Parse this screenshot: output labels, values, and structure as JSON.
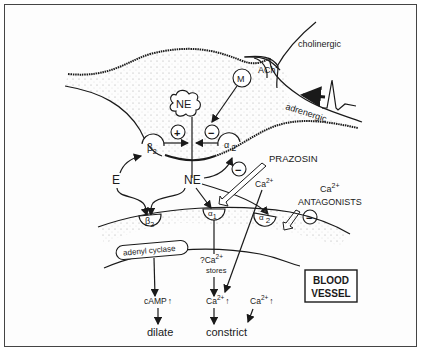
{
  "diagram": {
    "neuron": {
      "vesicle_label": "NE",
      "stimulate_sign": "+",
      "inhibit_sign": "−",
      "presyn_beta2": "β",
      "presyn_beta2_sub": "2",
      "presyn_alpha2": "α",
      "presyn_alpha2_sub": "2",
      "muscarinic_label": "M"
    },
    "nerves": {
      "cholinergic_label": "cholinergic",
      "ach_label": "ACh",
      "adrenergic_label": "adrenergic"
    },
    "agonists": {
      "epinephrine": "E",
      "norepinephrine": "NE"
    },
    "drugs": {
      "prazosin_label": "PRAZOSIN",
      "prazosin_sign": "−",
      "ca_antagonists_line1": "Ca",
      "ca_antagonists_sup": "2+",
      "ca_antagonists_line2": "ANTAGONISTS",
      "ca_antagonists_sign": "−"
    },
    "vessel": {
      "receptor_beta2": "β",
      "receptor_beta2_sub": "2",
      "receptor_alpha1": "α",
      "receptor_alpha1_sub": "1",
      "receptor_alpha2": "α",
      "receptor_alpha2_sub": "2",
      "enzyme_label": "adenyl cyclase",
      "ca_stores_line1": "?Ca",
      "ca_stores_sup": "2+",
      "ca_stores_line2": "stores",
      "extracellular_ca": "Ca",
      "extracellular_ca_sup": "2+",
      "camp_label": "cAMP",
      "ca_up_1": "Ca",
      "ca_up_1_sup": "2+",
      "ca_up_2": "Ca",
      "ca_up_2_sup": "2+",
      "up_arrow": "↑",
      "outcome_dilate": "dilate",
      "outcome_constrict": "constrict",
      "title_line1": "BLOOD",
      "title_line2": "VESSEL"
    }
  }
}
